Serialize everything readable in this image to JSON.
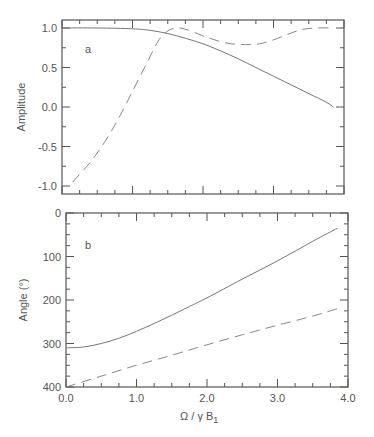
{
  "chart_data": [
    {
      "type": "line",
      "panel_label": "a",
      "title": "",
      "xlabel": "",
      "ylabel": "Amplitude",
      "xlim": [
        0.0,
        4.0
      ],
      "ylim": [
        -1.05,
        1.1
      ],
      "x_ticks": [
        "0.0",
        "1.0",
        "2.0",
        "3.0",
        "4.0"
      ],
      "x_tick_labels_shown": false,
      "y_ticks": [
        "1.0",
        "0.5",
        "0.0",
        "-0.5",
        "-1.0"
      ],
      "grid": false,
      "legend": null,
      "series": [
        {
          "name": "solid",
          "style": "solid",
          "x": [
            0.0,
            0.5,
            1.0,
            1.25,
            1.5,
            1.75,
            2.0,
            2.25,
            2.5,
            2.75,
            3.0,
            3.25,
            3.5,
            3.75,
            3.85
          ],
          "y": [
            1.0,
            1.0,
            0.99,
            0.97,
            0.93,
            0.87,
            0.8,
            0.71,
            0.61,
            0.5,
            0.39,
            0.28,
            0.17,
            0.06,
            0.0
          ]
        },
        {
          "name": "dashed",
          "style": "dashed",
          "x": [
            0.15,
            0.4,
            0.6,
            0.8,
            1.0,
            1.2,
            1.4,
            1.6,
            1.8,
            2.0,
            2.2,
            2.4,
            2.6,
            2.8,
            3.0,
            3.2,
            3.4,
            3.6,
            3.85
          ],
          "y": [
            -0.95,
            -0.7,
            -0.45,
            -0.15,
            0.2,
            0.55,
            0.88,
            1.0,
            0.97,
            0.9,
            0.84,
            0.8,
            0.79,
            0.8,
            0.85,
            0.92,
            0.98,
            1.0,
            1.0
          ]
        }
      ]
    },
    {
      "type": "line",
      "panel_label": "b",
      "title": "",
      "xlabel": "Ω / γ B1",
      "ylabel": "Angle (°)",
      "xlim": [
        0.0,
        4.0
      ],
      "ylim": [
        0,
        400
      ],
      "x_ticks": [
        "0.0",
        "1.0",
        "2.0",
        "3.0",
        "4.0"
      ],
      "y_ticks": [
        "0",
        "100",
        "200",
        "300",
        "400"
      ],
      "grid": false,
      "legend": null,
      "series": [
        {
          "name": "solid",
          "style": "solid",
          "x": [
            0.0,
            0.25,
            0.5,
            0.75,
            1.0,
            1.25,
            1.5,
            1.75,
            2.0,
            2.5,
            3.0,
            3.5,
            3.85
          ],
          "y": [
            90,
            92,
            100,
            112,
            128,
            146,
            165,
            185,
            205,
            248,
            290,
            335,
            365
          ]
        },
        {
          "name": "dashed",
          "style": "dashed",
          "x": [
            0.0,
            0.5,
            1.0,
            1.5,
            2.0,
            2.5,
            3.0,
            3.5,
            3.85
          ],
          "y": [
            0,
            25,
            50,
            73,
            97,
            120,
            142,
            163,
            180
          ]
        }
      ]
    }
  ],
  "labels": {
    "panel_a": "a",
    "panel_b": "b",
    "ylabel_a": "Amplitude",
    "ylabel_b": "Angle (°)",
    "xlabel_main": "Ω / γ B",
    "xlabel_sub": "1"
  }
}
